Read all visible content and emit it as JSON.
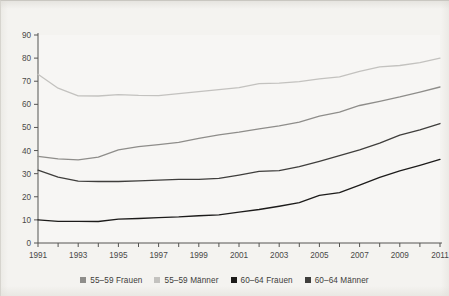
{
  "chart_data": {
    "type": "line",
    "title": "",
    "subtitle": "",
    "xlabel": "",
    "ylabel": "",
    "xlim": [
      1991,
      2011
    ],
    "ylim": [
      0,
      90
    ],
    "ytick_step": 10,
    "xtick_step": 1,
    "xlabel_step": 2,
    "grid": false,
    "legend_position": "bottom",
    "x": [
      1991,
      1992,
      1993,
      1994,
      1995,
      1996,
      1997,
      1998,
      1999,
      2000,
      2001,
      2002,
      2003,
      2004,
      2005,
      2006,
      2007,
      2008,
      2009,
      2010,
      2011
    ],
    "xtick_labels": [
      "1991",
      "",
      "1993",
      "",
      "1995",
      "",
      "1997",
      "",
      "1999",
      "",
      "2001",
      "",
      "2003",
      "",
      "2005",
      "",
      "2007",
      "",
      "2009",
      "",
      "2011"
    ],
    "ytick_labels": [
      "0",
      "10",
      "20",
      "30",
      "40",
      "50",
      "60",
      "70",
      "80",
      "90"
    ],
    "ytick_values": [
      0,
      10,
      20,
      30,
      40,
      50,
      60,
      70,
      80,
      90
    ],
    "series": [
      {
        "name": "55-59 Männer",
        "color": "#c3c2bf",
        "values": [
          73.0,
          67.0,
          63.7,
          63.6,
          64.2,
          63.9,
          63.8,
          64.6,
          65.5,
          66.4,
          67.2,
          69.0,
          69.2,
          69.8,
          71.0,
          71.9,
          74.3,
          76.2,
          76.8,
          78.0,
          80.0
        ]
      },
      {
        "name": "55-59 Frauen",
        "color": "#8e8d8a",
        "values": [
          37.5,
          36.4,
          36.0,
          37.2,
          40.3,
          41.7,
          42.6,
          43.5,
          45.3,
          46.8,
          48.0,
          49.4,
          50.7,
          52.3,
          54.9,
          56.6,
          59.5,
          61.3,
          63.2,
          65.3,
          67.5
        ]
      },
      {
        "name": "60-64 Männer",
        "color": "#3f3e3c",
        "values": [
          31.5,
          28.5,
          26.8,
          26.6,
          26.6,
          26.9,
          27.2,
          27.5,
          27.5,
          28.0,
          29.4,
          31.0,
          31.3,
          33.0,
          35.3,
          37.8,
          40.3,
          43.2,
          46.7,
          49.0,
          51.7
        ]
      },
      {
        "name": "60-64 Frauen",
        "color": "#1c1b1a",
        "values": [
          10.0,
          9.4,
          9.4,
          9.3,
          10.3,
          10.6,
          11.0,
          11.3,
          11.8,
          12.2,
          13.4,
          14.5,
          15.9,
          17.5,
          20.6,
          21.8,
          25.0,
          28.4,
          31.2,
          33.6,
          36.2
        ]
      }
    ],
    "legend": [
      {
        "label": "55–59 Frauen",
        "color": "#8e8d8a",
        "swatch": "square"
      },
      {
        "label": "55–59 Männer",
        "color": "#c3c2bf",
        "swatch": "square"
      },
      {
        "label": "60–64 Frauen",
        "color": "#1c1b1a",
        "swatch": "square"
      },
      {
        "label": "60–64 Männer",
        "color": "#3f3e3c",
        "swatch": "square"
      }
    ]
  },
  "axes": {
    "y_ticks": [
      "90",
      "80",
      "70",
      "60",
      "50",
      "40",
      "30",
      "20",
      "10",
      "0"
    ],
    "x_ticks": [
      "1991",
      "1993",
      "1995",
      "1997",
      "1999",
      "2001",
      "2003",
      "2005",
      "2007",
      "2009",
      "2011"
    ]
  },
  "colors": {
    "background": "#f4f3f0",
    "plot_background": "#f7f6f4",
    "axis": "#555452",
    "text": "#4a4947"
  }
}
